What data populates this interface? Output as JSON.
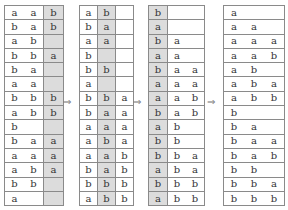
{
  "diagram": {
    "arrow_symbol": "⇒",
    "tables": [
      {
        "shaded_column": 2,
        "rows": [
          [
            "a",
            "a",
            "b"
          ],
          [
            "b",
            "a",
            "b"
          ],
          [
            "a",
            "b",
            ""
          ],
          [
            "b",
            "b",
            "a"
          ],
          [
            "b",
            "a",
            ""
          ],
          [
            "a",
            "a",
            ""
          ],
          [
            "b",
            "b",
            "b"
          ],
          [
            "a",
            "b",
            "b"
          ],
          [
            "b",
            "",
            ""
          ],
          [
            "b",
            "a",
            "a"
          ],
          [
            "a",
            "a",
            "a"
          ],
          [
            "a",
            "b",
            "a"
          ],
          [
            "b",
            "b",
            ""
          ],
          [
            "a",
            "",
            ""
          ]
        ]
      },
      {
        "shaded_column": 1,
        "rows": [
          [
            "a",
            "b",
            ""
          ],
          [
            "b",
            "a",
            ""
          ],
          [
            "a",
            "a",
            ""
          ],
          [
            "b",
            "",
            ""
          ],
          [
            "b",
            "b",
            ""
          ],
          [
            "a",
            "",
            ""
          ],
          [
            "b",
            "b",
            "a"
          ],
          [
            "b",
            "a",
            "a"
          ],
          [
            "a",
            "a",
            "a"
          ],
          [
            "a",
            "b",
            "a"
          ],
          [
            "a",
            "a",
            "b"
          ],
          [
            "b",
            "a",
            "b"
          ],
          [
            "b",
            "b",
            "b"
          ],
          [
            "a",
            "b",
            "b"
          ]
        ]
      },
      {
        "shaded_column": 0,
        "rows": [
          [
            "b",
            "",
            ""
          ],
          [
            "a",
            "",
            ""
          ],
          [
            "b",
            "a",
            ""
          ],
          [
            "a",
            "a",
            ""
          ],
          [
            "b",
            "a",
            "a"
          ],
          [
            "a",
            "a",
            "a"
          ],
          [
            "a",
            "a",
            "b"
          ],
          [
            "b",
            "a",
            "b"
          ],
          [
            "a",
            "b",
            ""
          ],
          [
            "b",
            "b",
            ""
          ],
          [
            "b",
            "b",
            "a"
          ],
          [
            "a",
            "b",
            "a"
          ],
          [
            "b",
            "b",
            "b"
          ],
          [
            "a",
            "b",
            "b"
          ]
        ]
      },
      {
        "shaded_column": null,
        "rows": [
          [
            "a",
            "",
            ""
          ],
          [
            "a",
            "a",
            ""
          ],
          [
            "a",
            "a",
            "a"
          ],
          [
            "a",
            "a",
            "b"
          ],
          [
            "a",
            "b",
            ""
          ],
          [
            "a",
            "b",
            "a"
          ],
          [
            "a",
            "b",
            "b"
          ],
          [
            "b",
            "",
            ""
          ],
          [
            "b",
            "a",
            ""
          ],
          [
            "b",
            "a",
            "a"
          ],
          [
            "b",
            "a",
            "b"
          ],
          [
            "b",
            "b",
            ""
          ],
          [
            "b",
            "b",
            "a"
          ],
          [
            "b",
            "b",
            "b"
          ]
        ]
      }
    ]
  }
}
